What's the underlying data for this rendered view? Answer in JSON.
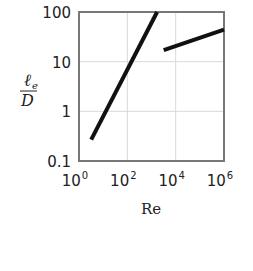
{
  "chart_data": {
    "type": "line",
    "title": "",
    "xlabel": "Re",
    "ylabel": "ℓe/D",
    "ylabel_parts": {
      "numerator": "ℓ",
      "subscript": "e",
      "denominator": "D"
    },
    "xscale": "log",
    "yscale": "log",
    "xlim": [
      1,
      1000000
    ],
    "ylim": [
      0.1,
      100
    ],
    "x_ticks": [
      {
        "base": "10",
        "exp": "0",
        "value": 1
      },
      {
        "base": "10",
        "exp": "2",
        "value": 100
      },
      {
        "base": "10",
        "exp": "4",
        "value": 10000
      },
      {
        "base": "10",
        "exp": "6",
        "value": 1000000
      }
    ],
    "y_ticks": [
      {
        "label": "100",
        "value": 100
      },
      {
        "label": "10",
        "value": 10
      },
      {
        "label": "1",
        "value": 1
      },
      {
        "label": "0.1",
        "value": 0.1
      }
    ],
    "grid": true,
    "legend": null,
    "series": [
      {
        "name": "laminar",
        "points": [
          {
            "x": 3.2,
            "y": 0.27
          },
          {
            "x": 1700,
            "y": 100
          }
        ]
      },
      {
        "name": "turbulent",
        "points": [
          {
            "x": 3200,
            "y": 17
          },
          {
            "x": 1000000,
            "y": 44
          }
        ]
      }
    ],
    "colors": {
      "line": "#111111",
      "frame": "#777777",
      "grid": "#d9d9d9"
    }
  }
}
